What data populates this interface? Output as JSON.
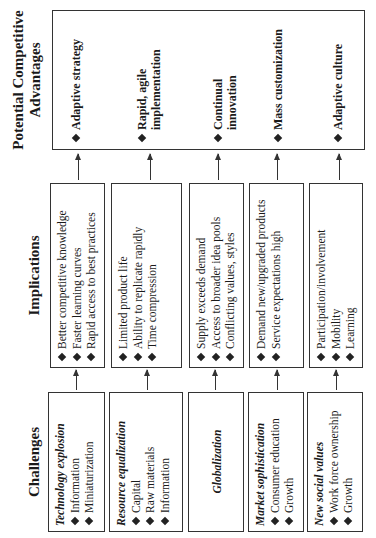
{
  "headers": {
    "challenges": "Challenges",
    "implications": "Implications",
    "advantages_line1": "Potential Competitive",
    "advantages_line2": "Advantages"
  },
  "rows": [
    {
      "challenge": {
        "title": "Technology explosion",
        "items": [
          "Information",
          "Miniaturization"
        ]
      },
      "implications": [
        "Better competitive knowledge",
        "Faster learning curves",
        "Rapid access to best practices"
      ],
      "advantage": [
        "Adaptive strategy"
      ]
    },
    {
      "challenge": {
        "title": "Resource equalization",
        "items": [
          "Capital",
          "Raw materials",
          "Information"
        ]
      },
      "implications": [
        "Limited product life",
        "Ability to replicate rapidly",
        "Time compression"
      ],
      "advantage": [
        "Rapid, agile",
        "implementation"
      ]
    },
    {
      "challenge": {
        "title": "Globalization",
        "items": []
      },
      "implications": [
        "Supply exceeds demand",
        "Access to broader idea pools",
        "Conflicting values, styles"
      ],
      "advantage": [
        "Continual",
        "innovation"
      ]
    },
    {
      "challenge": {
        "title": "Market sophistication",
        "items": [
          "Consumer education",
          "Growth"
        ]
      },
      "implications": [
        "Demand new/upgraded products",
        "Service expectations high"
      ],
      "advantage": [
        "Mass customization"
      ]
    },
    {
      "challenge": {
        "title": "New social values",
        "items": [
          "Work force ownership",
          "Growth"
        ]
      },
      "implications": [
        "Participation/involvement",
        "Mobility",
        "Learning"
      ],
      "advantage": [
        "Adaptive culture"
      ]
    }
  ],
  "colors": {
    "line": "#333333",
    "text": "#1a1a1a",
    "background": "#ffffff"
  }
}
